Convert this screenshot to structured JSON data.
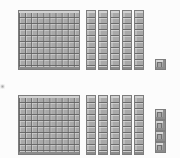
{
  "canvas": {
    "width": 180,
    "height": 158,
    "background_color": "#fcfcfc",
    "block_fill_color": "#a9a9a9",
    "block_line_color": "#5f5f5f",
    "block_highlight_color": "#d2d2d2",
    "block_shadow_color": "#8b8b8b"
  },
  "groups": [
    {
      "id": "top-group",
      "flats": 1,
      "rods": 5,
      "units": 1,
      "flat_value": 100,
      "rod_value": 10,
      "unit_value": 1,
      "total": 151,
      "flat": {
        "x": 18,
        "y": 10,
        "width": 62,
        "height": 60,
        "rows": 10,
        "cols": 10
      },
      "rod_row": {
        "x": 86,
        "y": 10,
        "width": 10,
        "height": 60,
        "pitch": 12,
        "segments": 10
      },
      "unit_positions": [
        {
          "x": 155,
          "y": 59,
          "size": 11
        }
      ]
    },
    {
      "id": "bottom-group",
      "flats": 1,
      "rods": 5,
      "units": 4,
      "flat_value": 100,
      "rod_value": 10,
      "unit_value": 1,
      "total": 154,
      "flat": {
        "x": 18,
        "y": 95,
        "width": 62,
        "height": 60,
        "rows": 10,
        "cols": 10
      },
      "rod_row": {
        "x": 86,
        "y": 95,
        "width": 10,
        "height": 60,
        "pitch": 12,
        "segments": 10
      },
      "unit_positions": [
        {
          "x": 155,
          "y": 109,
          "size": 11
        },
        {
          "x": 155,
          "y": 120,
          "size": 11
        },
        {
          "x": 155,
          "y": 131,
          "size": 11
        },
        {
          "x": 155,
          "y": 142,
          "size": 11
        }
      ]
    }
  ],
  "artifacts": [
    {
      "id": "left-edge-smudge",
      "x": 0,
      "y": 84
    }
  ]
}
